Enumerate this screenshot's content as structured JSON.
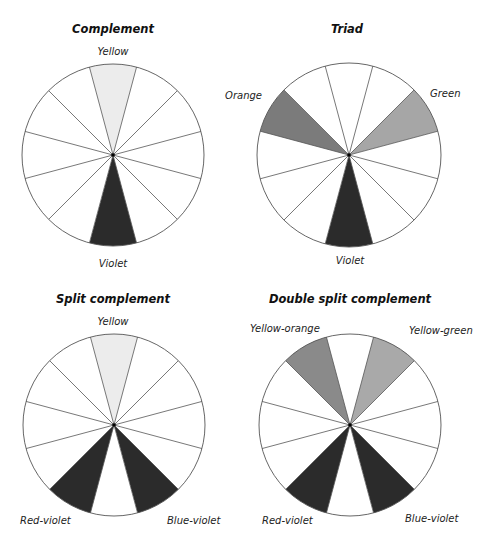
{
  "colors": {
    "Yellow": "#ececec",
    "Yellow-green": "#a9a9a9",
    "Green": "#a6a6a6",
    "Orange": "#7b7b7b",
    "Yellow-orange": "#8a8a8a",
    "Violet": "#2b2b2b",
    "Red-violet": "#2b2b2b",
    "Blue-violet": "#2b2b2b",
    "empty": "#ffffff",
    "line": "#555555"
  },
  "segments_per_wheel": 12,
  "wheels": [
    {
      "id": "complement",
      "title": "Complement",
      "cx": 113,
      "cy": 155,
      "r": 91,
      "title_pos": [
        113,
        33
      ],
      "filled": [
        {
          "index": 0,
          "color": "Yellow"
        },
        {
          "index": 6,
          "color": "Violet"
        }
      ],
      "labels": [
        {
          "text": "Yellow",
          "x": 113,
          "y": 55,
          "anchor": "middle"
        },
        {
          "text": "Violet",
          "x": 113,
          "y": 267,
          "anchor": "middle"
        }
      ]
    },
    {
      "id": "triad",
      "title": "Triad",
      "cx": 349,
      "cy": 155,
      "r": 92,
      "title_pos": [
        347,
        33
      ],
      "filled": [
        {
          "index": 10,
          "color": "Orange"
        },
        {
          "index": 2,
          "color": "Green"
        },
        {
          "index": 6,
          "color": "Violet"
        }
      ],
      "labels": [
        {
          "text": "Orange",
          "x": 262,
          "y": 99,
          "anchor": "end"
        },
        {
          "text": "Green",
          "x": 430,
          "y": 97,
          "anchor": "start"
        },
        {
          "text": "Violet",
          "x": 350,
          "y": 264,
          "anchor": "middle"
        }
      ]
    },
    {
      "id": "split-complement",
      "title": "Split complement",
      "cx": 114,
      "cy": 425,
      "r": 91,
      "title_pos": [
        113,
        303
      ],
      "filled": [
        {
          "index": 0,
          "color": "Yellow"
        },
        {
          "index": 5,
          "color": "Blue-violet"
        },
        {
          "index": 7,
          "color": "Red-violet"
        }
      ],
      "labels": [
        {
          "text": "Yellow",
          "x": 113,
          "y": 325,
          "anchor": "middle"
        },
        {
          "text": "Red-violet",
          "x": 20,
          "y": 524,
          "anchor": "start"
        },
        {
          "text": "Blue-violet",
          "x": 167,
          "y": 524,
          "anchor": "start"
        }
      ]
    },
    {
      "id": "double-split-complement",
      "title": "Double split complement",
      "cx": 350,
      "cy": 425,
      "r": 91,
      "title_pos": [
        350,
        303
      ],
      "filled": [
        {
          "index": 11,
          "color": "Yellow-orange"
        },
        {
          "index": 1,
          "color": "Yellow-green"
        },
        {
          "index": 5,
          "color": "Blue-violet"
        },
        {
          "index": 7,
          "color": "Red-violet"
        }
      ],
      "labels": [
        {
          "text": "Yellow-orange",
          "x": 250,
          "y": 332,
          "anchor": "start"
        },
        {
          "text": "Yellow-green",
          "x": 409,
          "y": 334,
          "anchor": "start"
        },
        {
          "text": "Red-violet",
          "x": 262,
          "y": 524,
          "anchor": "start"
        },
        {
          "text": "Blue-violet",
          "x": 405,
          "y": 522,
          "anchor": "start"
        }
      ]
    }
  ]
}
